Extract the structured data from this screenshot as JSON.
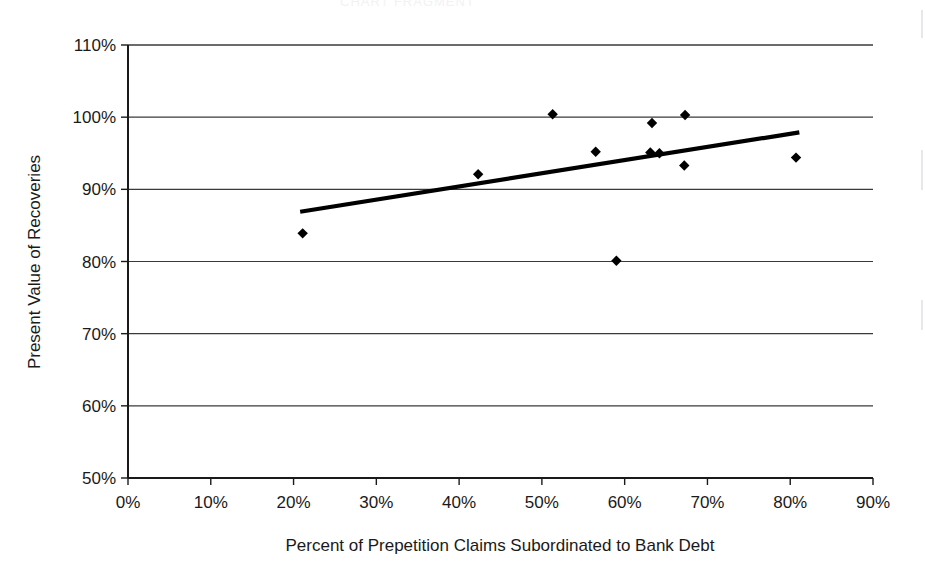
{
  "chart_data": {
    "type": "scatter",
    "title": "",
    "xlabel": "Percent of Prepetition Claims Subordinated to Bank Debt",
    "ylabel": "Present Value of Recoveries",
    "xlim": [
      0,
      90
    ],
    "ylim": [
      50,
      110
    ],
    "grid": "horizontal",
    "legend": "none",
    "xticks": [
      "0%",
      "10%",
      "20%",
      "30%",
      "40%",
      "50%",
      "60%",
      "70%",
      "80%",
      "90%"
    ],
    "xtick_values": [
      0,
      10,
      20,
      30,
      40,
      50,
      60,
      70,
      80,
      90
    ],
    "yticks": [
      "50%",
      "60%",
      "70%",
      "80%",
      "90%",
      "100%",
      "110%"
    ],
    "ytick_values": [
      50,
      60,
      70,
      80,
      90,
      100,
      110
    ],
    "marker": "diamond",
    "marker_color": "#000000",
    "points": [
      {
        "x": 21.1,
        "y": 83.9
      },
      {
        "x": 42.3,
        "y": 92.1
      },
      {
        "x": 51.3,
        "y": 100.4
      },
      {
        "x": 56.5,
        "y": 95.2
      },
      {
        "x": 59.0,
        "y": 80.1
      },
      {
        "x": 63.3,
        "y": 99.2
      },
      {
        "x": 63.1,
        "y": 95.1
      },
      {
        "x": 64.2,
        "y": 95.0
      },
      {
        "x": 67.3,
        "y": 100.3
      },
      {
        "x": 67.2,
        "y": 93.3
      },
      {
        "x": 80.7,
        "y": 94.4
      }
    ],
    "trendline": {
      "type": "linear",
      "color": "#000000",
      "x_start": 20.8,
      "y_start": 86.9,
      "x_end": 81.1,
      "y_end": 97.9
    }
  },
  "scan": {
    "top_artifact_text": "CHART FRAGMENT"
  }
}
